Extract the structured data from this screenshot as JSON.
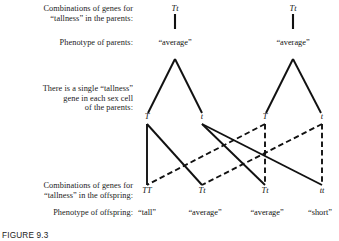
{
  "figure": {
    "caption": "FIGURE 9.3",
    "row_labels": [
      "Combinations of genes for\n“tallness” in the parents:",
      "Phenotype of parents:",
      "There is a single “tallness”\ngene in each sex cell\nof the parents:",
      "Combinations of genes for\n“tallness” in the offspring:",
      "Phenotype of offspring:"
    ],
    "parents": [
      {
        "genotype": "Tt",
        "phenotype": "“average”"
      },
      {
        "genotype": "Tt",
        "phenotype": "“average”"
      }
    ],
    "gametes": [
      "T",
      "t",
      "T",
      "t"
    ],
    "offspring": [
      {
        "genotype": "TT",
        "phenotype": "“tall”"
      },
      {
        "genotype": "Tt",
        "phenotype": "“average”"
      },
      {
        "genotype": "Tt",
        "phenotype": "“average”"
      },
      {
        "genotype": "tt",
        "phenotype": "“short”"
      }
    ],
    "colors": {
      "ink": "#111111",
      "background": "#ffffff"
    }
  }
}
